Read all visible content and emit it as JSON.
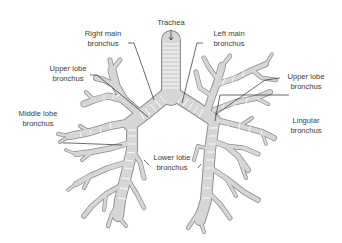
{
  "diagram": {
    "colors": {
      "airway_outline": "#8a8a8a",
      "airway_fill": "#d6d6d6",
      "cartilage_ring": "#ffffff",
      "label_text": "#3a3a3a",
      "leader_line": "#2b2b2b",
      "background": "#ffffff"
    },
    "labels": {
      "trachea": "Trachea",
      "right_main_line1": "Right main",
      "right_main_line2": "bronchus",
      "left_main_line1": "Left main",
      "left_main_line2": "bronchus",
      "right_upper_line1": "Upper lobe",
      "right_upper_line2": "bronchus",
      "left_upper_line1": "Upper lobe",
      "left_upper_line2": "bronchus",
      "middle_line1": "Middle lobe",
      "middle_line2": "bronchus",
      "lingular_line1": "Lingular",
      "lingular_line2": "bronchus",
      "lower_line1": "Lower lobe",
      "lower_line2": "bronchus"
    }
  }
}
